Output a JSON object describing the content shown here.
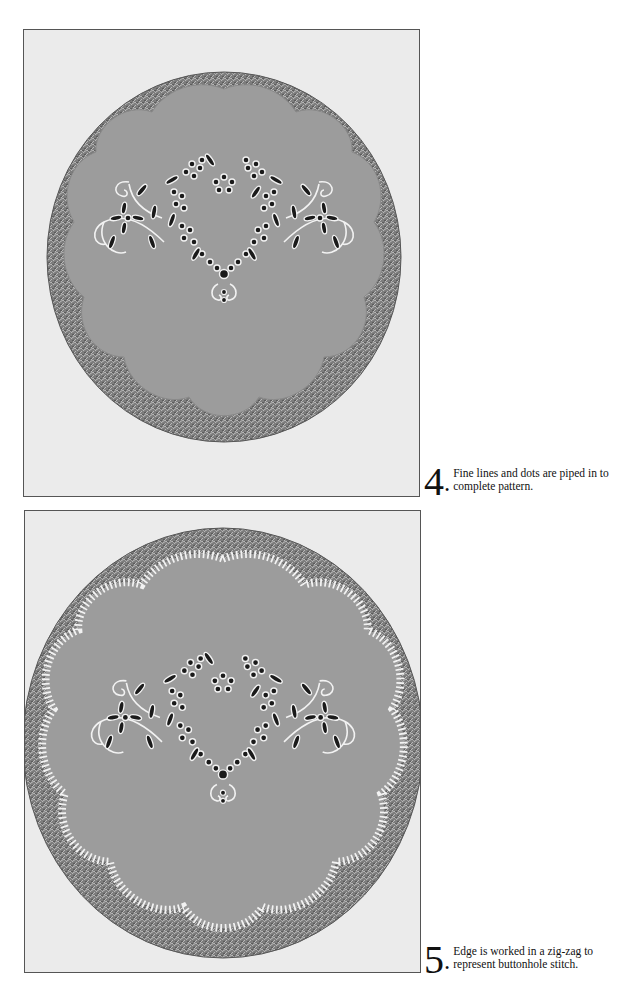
{
  "steps": [
    {
      "number": "4",
      "bullet": "•",
      "caption": "Fine lines and dots are piped in to complete pattern.",
      "image": {
        "subject": "scalloped-sugar-plaque-on-silver-cake-board",
        "edge": "plain"
      }
    },
    {
      "number": "5",
      "bullet": "•",
      "caption": "Edge is worked in a zig-zag to represent buttonhole stitch.",
      "image": {
        "subject": "scalloped-sugar-plaque-on-silver-cake-board",
        "edge": "buttonhole-stitch"
      }
    }
  ],
  "colors": {
    "page": "#ffffff",
    "photo_background": "#ebebeb",
    "board_silver": "#8a8a8a",
    "plaque": "#9c9c9c",
    "piping": "#f2f2f2",
    "holes": "#1a1a1a",
    "text": "#111111"
  }
}
